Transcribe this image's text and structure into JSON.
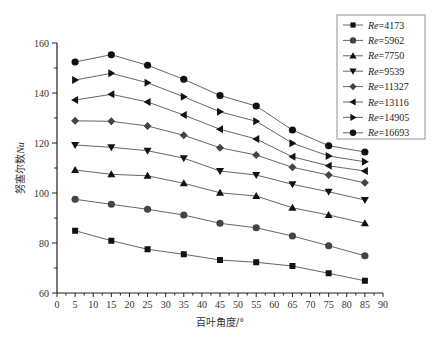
{
  "chart_data": {
    "type": "line",
    "title": "",
    "xlabel": "百叶角度/°",
    "ylabel": "努塞尔数Nu",
    "ylabel_plain": "努塞尔数",
    "ylabel_italic": "Nu",
    "xlim": [
      0,
      90
    ],
    "ylim": [
      60,
      160
    ],
    "x_ticks": [
      0,
      5,
      10,
      15,
      20,
      25,
      30,
      35,
      40,
      45,
      50,
      55,
      60,
      65,
      70,
      75,
      80,
      85,
      90
    ],
    "y_ticks": [
      60,
      80,
      100,
      120,
      140,
      160
    ],
    "grid": false,
    "legend_position": "upper right (outside plot, boxed)",
    "x": [
      5,
      15,
      25,
      35,
      45,
      55,
      65,
      75,
      85
    ],
    "series": [
      {
        "name": "Re=4173",
        "re": "4173",
        "marker": "square",
        "values": [
          84.9,
          80.9,
          77.5,
          75.5,
          73.2,
          72.3,
          70.8,
          67.9,
          64.9
        ]
      },
      {
        "name": "Re=5962",
        "re": "5962",
        "marker": "circle",
        "values": [
          97.5,
          95.5,
          93.5,
          91.2,
          87.9,
          86.1,
          82.8,
          78.9,
          74.9
        ]
      },
      {
        "name": "Re=7750",
        "re": "7750",
        "marker": "triangle-up",
        "values": [
          109.2,
          107.5,
          106.9,
          103.9,
          100.1,
          98.8,
          94.1,
          91.2,
          87.9
        ]
      },
      {
        "name": "Re=9539",
        "re": "9539",
        "marker": "triangle-down",
        "values": [
          119.2,
          118.3,
          116.9,
          113.9,
          108.8,
          107.2,
          103.5,
          100.5,
          97.2
        ]
      },
      {
        "name": "Re=11327",
        "re": "11327",
        "marker": "diamond",
        "values": [
          128.9,
          128.7,
          126.8,
          123.1,
          118.1,
          115.2,
          110.3,
          107.2,
          104.1
        ]
      },
      {
        "name": "Re=13116",
        "re": "13116",
        "marker": "triangle-left",
        "values": [
          137.2,
          139.5,
          136.4,
          131.2,
          125.5,
          121.6,
          114.5,
          110.9,
          108.8
        ]
      },
      {
        "name": "Re=14905",
        "re": "14905",
        "marker": "triangle-right",
        "values": [
          145.2,
          147.9,
          144.1,
          138.5,
          132.5,
          128.7,
          119.9,
          114.8,
          112.5
        ]
      },
      {
        "name": "Re=16693",
        "re": "16693",
        "marker": "hexagon",
        "values": [
          152.4,
          155.3,
          151.1,
          145.5,
          139.0,
          134.8,
          125.2,
          118.9,
          116.4
        ]
      }
    ]
  },
  "legend": {
    "prefix": "Re",
    "items": [
      "=4173",
      "=5962",
      "=7750",
      "=9539",
      "=11327",
      "=13116",
      "=14905",
      "=16693"
    ]
  },
  "axes": {
    "x_title": "百叶角度/°",
    "y_title": "努塞尔数Nu"
  },
  "colors": {
    "line": "#555555",
    "marker_dark": "#111111",
    "marker_gray": "#444444",
    "axis": "#222222"
  }
}
